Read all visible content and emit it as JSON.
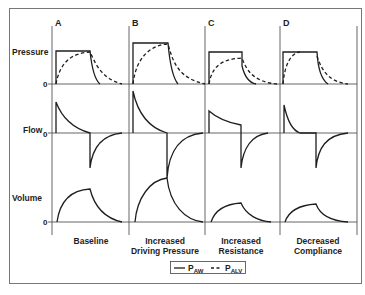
{
  "figure": {
    "panels": [
      {
        "letter": "A",
        "caption_line1": "Baseline",
        "caption_line2": ""
      },
      {
        "letter": "B",
        "caption_line1": "Increased",
        "caption_line2": "Driving Pressure"
      },
      {
        "letter": "C",
        "caption_line1": "Increased",
        "caption_line2": "Resistance"
      },
      {
        "letter": "D",
        "caption_line1": "Decreased",
        "caption_line2": "Compliance"
      }
    ],
    "row_labels": {
      "pressure": "Pressure",
      "flow": "Flow",
      "volume": "Volume"
    },
    "zero_labels": {
      "pressure": "0",
      "flow": "0",
      "volume": "0"
    },
    "legend": {
      "solid_label": "P",
      "solid_sub": "AW",
      "dashed_label": "P",
      "dashed_sub": "ALV"
    },
    "colors": {
      "line": "#1e1e1e",
      "grid": "#555555",
      "frame": "#777777",
      "background": "#ffffff"
    }
  }
}
